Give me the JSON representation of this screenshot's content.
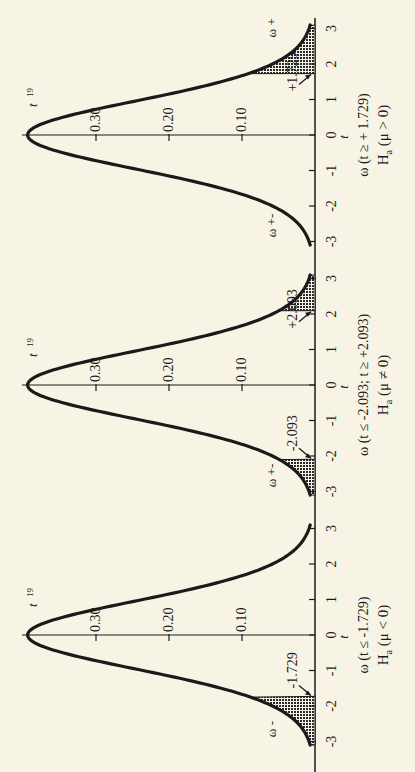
{
  "figure": {
    "background": "#f7f4e6",
    "ink": "#1a1a1a",
    "orientation": "rotated 90° (t-axis vertical, density increases to the left)"
  },
  "chart_data": [
    {
      "type": "area",
      "title": "t 19",
      "distribution": "t",
      "df": 19,
      "xlabel": "t",
      "ylabel": "density",
      "x_ticks": [
        -3,
        -2,
        -1,
        0,
        1,
        2,
        3
      ],
      "y_ticks": [
        0.1,
        0.2,
        0.3
      ],
      "y_tick_labels": [
        "0.10",
        "0.20",
        "0.30"
      ],
      "xlim": [
        -3,
        3
      ],
      "ylim": [
        0,
        0.4
      ],
      "critical_values": [
        1.729
      ],
      "critical_labels": [
        "+1.729"
      ],
      "shaded_region": "t >= 1.729",
      "region_labels": {
        "rejection": "ω +",
        "acceptance": "ω +-"
      },
      "caption_line1": "ω (t ≥ + 1.729)",
      "caption_line2": "Ha (μ > 0)",
      "x": [
        -3,
        -2.5,
        -2,
        -1.5,
        -1,
        -0.5,
        0,
        0.5,
        1,
        1.5,
        2,
        2.5,
        3
      ],
      "values": [
        0.0075,
        0.0202,
        0.0531,
        0.1266,
        0.238,
        0.3465,
        0.3939,
        0.3465,
        0.238,
        0.1266,
        0.0531,
        0.0202,
        0.0075
      ]
    },
    {
      "type": "area",
      "title": "t 19",
      "distribution": "t",
      "df": 19,
      "xlabel": "t",
      "ylabel": "density",
      "x_ticks": [
        -3,
        -2,
        -1,
        0,
        1,
        2,
        3
      ],
      "y_ticks": [
        0.1,
        0.2,
        0.3
      ],
      "y_tick_labels": [
        "0.10",
        "0.20",
        "0.30"
      ],
      "xlim": [
        -3,
        3
      ],
      "ylim": [
        0,
        0.4
      ],
      "critical_values": [
        -2.093,
        2.093
      ],
      "critical_labels": [
        "-2.093",
        "+2.093"
      ],
      "shaded_region": "t <= -2.093 or t >= 2.093",
      "region_labels": {
        "acceptance": "ω +-"
      },
      "caption_line1": "ω (t ≤ -2.093; t ≥ +2.093)",
      "caption_line2": "Ha (μ ≠ 0)",
      "x": [
        -3,
        -2.5,
        -2,
        -1.5,
        -1,
        -0.5,
        0,
        0.5,
        1,
        1.5,
        2,
        2.5,
        3
      ],
      "values": [
        0.0075,
        0.0202,
        0.0531,
        0.1266,
        0.238,
        0.3465,
        0.3939,
        0.3465,
        0.238,
        0.1266,
        0.0531,
        0.0202,
        0.0075
      ]
    },
    {
      "type": "area",
      "title": "t 19",
      "distribution": "t",
      "df": 19,
      "xlabel": "t",
      "ylabel": "density",
      "x_ticks": [
        -3,
        -2,
        -1,
        0,
        1,
        2,
        3
      ],
      "y_ticks": [
        0.1,
        0.2,
        0.3
      ],
      "y_tick_labels": [
        "0.10",
        "0.20",
        "0.30"
      ],
      "xlim": [
        -3,
        3
      ],
      "ylim": [
        0,
        0.4
      ],
      "critical_values": [
        -1.729
      ],
      "critical_labels": [
        "-1.729"
      ],
      "shaded_region": "t <= -1.729",
      "region_labels": {
        "rejection": "ω -"
      },
      "caption_line1": "ω (t ≤ -1.729)",
      "caption_line2": "Ha (μ < 0)",
      "x": [
        -3,
        -2.5,
        -2,
        -1.5,
        -1,
        -0.5,
        0,
        0.5,
        1,
        1.5,
        2,
        2.5,
        3
      ],
      "values": [
        0.0075,
        0.0202,
        0.0531,
        0.1266,
        0.238,
        0.3465,
        0.3939,
        0.3465,
        0.238,
        0.1266,
        0.0531,
        0.0202,
        0.0075
      ]
    }
  ],
  "panels": [
    {
      "dist_label": "t",
      "dist_sub": "19",
      "ticks": [
        "3",
        "2",
        "1",
        "0",
        "-1",
        "-2",
        "-3"
      ],
      "axis_var": "t",
      "y_labels": [
        "0.30",
        "0.20",
        "0.10"
      ],
      "crit_right": "+1.729",
      "crit_left": "",
      "omega_top": "ω +",
      "omega_bottom": "ω +-",
      "caption1": "ω (t ≥ + 1.729)",
      "caption2_H": "H",
      "caption2_sub": "a",
      "caption2_rest": "(μ > 0)"
    },
    {
      "dist_label": "t",
      "dist_sub": "19",
      "ticks": [
        "3",
        "2",
        "1",
        "0",
        "-1",
        "-2",
        "-3"
      ],
      "axis_var": "t",
      "y_labels": [
        "0.30",
        "0.20",
        "0.10"
      ],
      "crit_right": "+2.093",
      "crit_left": "-2.093",
      "omega_top": "",
      "omega_bottom": "ω +-",
      "caption1": "ω (t ≤ -2.093; t ≥ +2.093)",
      "caption2_H": "H",
      "caption2_sub": "a",
      "caption2_rest": "(μ ≠ 0)"
    },
    {
      "dist_label": "t",
      "dist_sub": "19",
      "ticks": [
        "3",
        "2",
        "1",
        "0",
        "-1",
        "-2",
        "-3"
      ],
      "axis_var": "t",
      "y_labels": [
        "0.30",
        "0.20",
        "0.10"
      ],
      "crit_right": "",
      "crit_left": "-1.729",
      "omega_top": "",
      "omega_bottom": "ω -",
      "caption1": "ω (t ≤ -1.729)",
      "caption2_H": "H",
      "caption2_sub": "a",
      "caption2_rest": "(μ < 0)"
    }
  ]
}
